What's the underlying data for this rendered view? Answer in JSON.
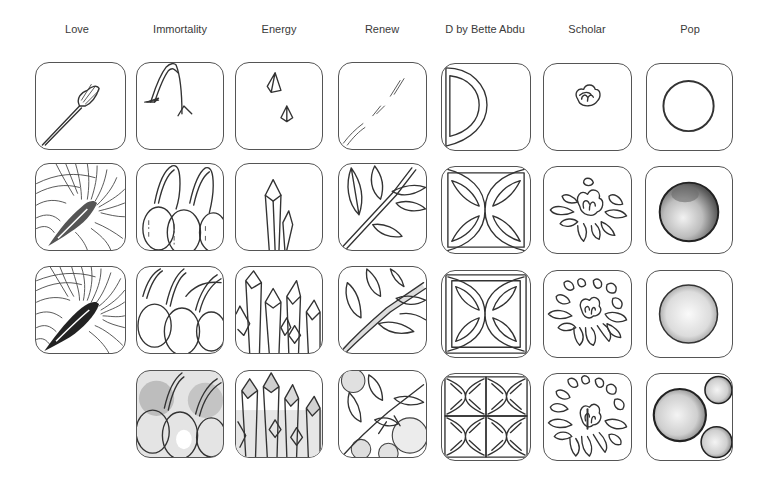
{
  "page": {
    "background": "#ffffff",
    "stroke_color": "#333333"
  },
  "columns": [
    {
      "label": "Love",
      "steps": [
        "feather-stem-start",
        "feather-plume-lines",
        "feather-plume-dense",
        null
      ]
    },
    {
      "label": "Immortality",
      "steps": [
        "cherry-stems-arch",
        "cherries-outlined",
        "cherries-overlapping",
        "cherries-shaded"
      ]
    },
    {
      "label": "Energy",
      "steps": [
        "crystal-tips",
        "crystal-single-cluster",
        "crystal-many",
        "crystal-shaded"
      ]
    },
    {
      "label": "Renew",
      "steps": [
        "diagonal-branch-guide",
        "branch-with-leaves",
        "branch-dense-leaves",
        "branch-leaves-berries-shaded"
      ]
    },
    {
      "label": "D by Bette Abdu",
      "steps": [
        "d-half-circle",
        "d-four-petal-square",
        "d-four-petal-refined",
        "d-grid-of-four"
      ]
    },
    {
      "label": "Scholar",
      "steps": [
        "bud-center",
        "small-chrysanthemum",
        "medium-chrysanthemum",
        "full-chrysanthemum"
      ]
    },
    {
      "label": "Pop",
      "steps": [
        "circle-outline",
        "circle-dark-shaded",
        "circle-light-shaded",
        "three-bubbles-shaded"
      ]
    }
  ]
}
